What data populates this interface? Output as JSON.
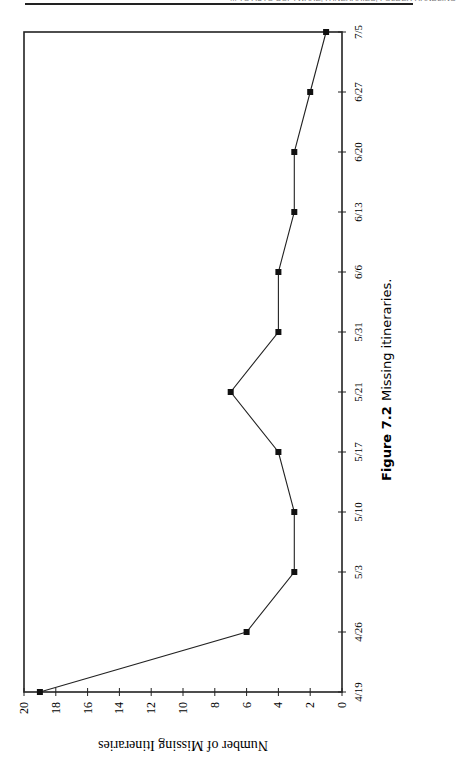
{
  "page": {
    "header_text": "... TO AUTO SOFTWARE; ITINERARIES, FOLDER HANDLING"
  },
  "figure": {
    "number_label": "Figure 7.2",
    "caption": "Missing itineraries."
  },
  "chart_data": {
    "type": "line",
    "title": "",
    "xlabel": "",
    "ylabel": "Number of Missing Itineraries",
    "categories": [
      "4/19",
      "4/26",
      "5/3",
      "5/10",
      "5/17",
      "5/21",
      "5/31",
      "6/6",
      "6/13",
      "6/20",
      "6/27",
      "7/5"
    ],
    "values": [
      19,
      6,
      3,
      3,
      4,
      7,
      4,
      4,
      3,
      3,
      2,
      1
    ],
    "ylim": [
      0,
      20
    ],
    "yticks": [
      0,
      2,
      4,
      6,
      8,
      10,
      12,
      14,
      16,
      18,
      20
    ],
    "grid": false,
    "legend": null,
    "marker": "square",
    "orientation": "rotated 90° counter-clockwise on page"
  }
}
